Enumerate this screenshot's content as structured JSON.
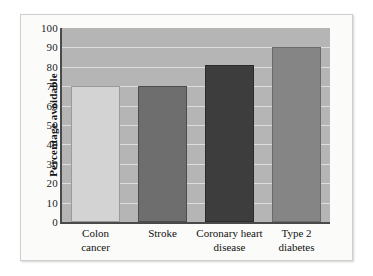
{
  "chart_data": {
    "type": "bar",
    "title": "",
    "xlabel": "",
    "ylabel": "Percentage avoidable",
    "ylim": [
      0,
      100
    ],
    "ytick_step": 10,
    "yticks": [
      "100",
      "90",
      "80",
      "70",
      "60",
      "50",
      "40",
      "30",
      "20",
      "10",
      "0"
    ],
    "grid": "horizontal",
    "legend": "none",
    "categories": [
      "Colon cancer",
      "Stroke",
      "Coronary heart disease",
      "Type 2 diabetes"
    ],
    "category_lines": [
      [
        "Colon",
        "cancer"
      ],
      [
        "Stroke"
      ],
      [
        "Coronary heart",
        "disease"
      ],
      [
        "Type 2",
        "diabetes"
      ]
    ],
    "values": [
      70,
      70,
      81,
      90
    ],
    "bar_colors": [
      "#d3d3d3",
      "#6e6e6e",
      "#3d3d3d",
      "#858585"
    ],
    "bar_border_colors": [
      "#9a9a9a",
      "#4d4d4d",
      "#2b2b2b",
      "#6a6a6a"
    ],
    "plot_background": "#b5b5b5",
    "gridline_color": "#e4e4e4",
    "axis_color": "#4a4a4a",
    "figure_background": "#fbfbfa",
    "page_background": "#ffffff"
  }
}
